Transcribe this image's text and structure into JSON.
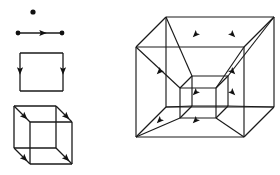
{
  "figure": {
    "background_color": "#ffffff",
    "stroke_color": "#1a1a1a",
    "fill_color": "#111111",
    "canvas": {
      "width": 280,
      "height": 175
    }
  },
  "chart_data": {
    "type": "diagram",
    "xlabel": "",
    "ylabel": "",
    "grid": false,
    "legend": "none",
    "xlim": [
      0,
      280
    ],
    "ylim": [
      0,
      175
    ],
    "annotations": [],
    "panels": [
      {
        "name": "point",
        "dimension": 0,
        "label": "",
        "vertices": 1,
        "edges": 0,
        "arrows": 0,
        "points": [
          [
            33,
            12
          ]
        ],
        "dot_radius": 2.6,
        "segments": [],
        "arrowheads": []
      },
      {
        "name": "line-segment",
        "dimension": 1,
        "label": "",
        "vertices": 2,
        "edges": 1,
        "arrows": 1,
        "points": [
          [
            18,
            33
          ],
          [
            62,
            33
          ]
        ],
        "dot_radius": 2.4,
        "segments": [
          [
            18,
            33,
            62,
            33
          ]
        ],
        "arrowheads": [
          {
            "x": 42,
            "y": 33,
            "angle": 0
          }
        ]
      },
      {
        "name": "square",
        "dimension": 2,
        "label": "",
        "vertices": 4,
        "edges": 4,
        "arrows": 2,
        "points": [],
        "dot_radius": 0,
        "segments": [
          [
            20,
            53,
            63,
            53
          ],
          [
            63,
            53,
            63,
            91
          ],
          [
            63,
            91,
            20,
            91
          ],
          [
            20,
            91,
            20,
            53
          ]
        ],
        "arrowheads": [
          {
            "x": 20,
            "y": 70,
            "angle": 90
          },
          {
            "x": 63,
            "y": 70,
            "angle": 90
          }
        ]
      },
      {
        "name": "cube",
        "dimension": 3,
        "label": "",
        "vertices": 8,
        "edges": 12,
        "arrows": 4,
        "points": [],
        "dot_radius": 0,
        "back_face": [
          14,
          106,
          56,
          106,
          56,
          148,
          14,
          148
        ],
        "front_face": [
          30,
          122,
          72,
          122,
          72,
          164,
          30,
          164
        ],
        "depth_offset": [
          16,
          16
        ],
        "segments": [
          [
            14,
            106,
            56,
            106
          ],
          [
            56,
            106,
            56,
            148
          ],
          [
            56,
            148,
            14,
            148
          ],
          [
            14,
            148,
            14,
            106
          ],
          [
            30,
            122,
            72,
            122
          ],
          [
            72,
            122,
            72,
            164
          ],
          [
            72,
            164,
            30,
            164
          ],
          [
            30,
            164,
            30,
            122
          ],
          [
            14,
            106,
            30,
            122
          ],
          [
            56,
            106,
            72,
            122
          ],
          [
            56,
            148,
            72,
            164
          ],
          [
            14,
            148,
            30,
            164
          ]
        ],
        "arrowheads": [
          {
            "x": 24,
            "y": 116,
            "angle": 45
          },
          {
            "x": 66,
            "y": 116,
            "angle": 45
          },
          {
            "x": 24,
            "y": 158,
            "angle": 45
          },
          {
            "x": 66,
            "y": 158,
            "angle": 45
          }
        ]
      },
      {
        "name": "tesseract",
        "dimension": 4,
        "label": "",
        "vertices": 16,
        "edges": 32,
        "arrows": 8,
        "points": [],
        "dot_radius": 0,
        "outer_cube": {
          "back_face": [
            136,
            47,
            244,
            47,
            244,
            137,
            136,
            137
          ],
          "front_face": [
            166,
            17,
            274,
            17,
            274,
            107,
            166,
            107
          ],
          "depth_offset": [
            30,
            -30
          ]
        },
        "inner_cube": {
          "back_face": [
            180,
            88,
            216,
            88,
            216,
            118,
            180,
            118
          ],
          "front_face": [
            192,
            76,
            228,
            76,
            228,
            106,
            192,
            106
          ],
          "depth_offset": [
            12,
            -12
          ]
        },
        "connector_arrowheads": [
          {
            "x": 160,
            "y": 71,
            "angle": 135
          },
          {
            "x": 196,
            "y": 34,
            "angle": 135
          },
          {
            "x": 232,
            "y": 34,
            "angle": 45
          },
          {
            "x": 232,
            "y": 71,
            "angle": 45
          },
          {
            "x": 196,
            "y": 92,
            "angle": 135
          },
          {
            "x": 232,
            "y": 92,
            "angle": 45
          },
          {
            "x": 160,
            "y": 120,
            "angle": 135
          },
          {
            "x": 196,
            "y": 120,
            "angle": 135
          }
        ]
      }
    ]
  }
}
